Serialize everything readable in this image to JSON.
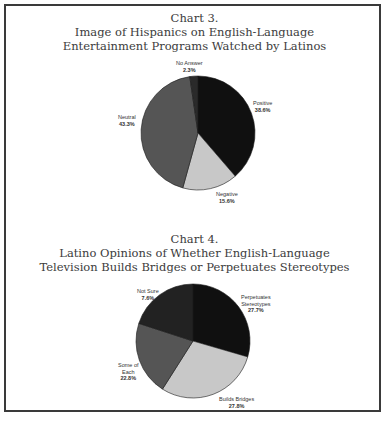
{
  "chart_data": [
    {
      "type": "pie",
      "title": "Chart 3.",
      "subtitle": "Image of Hispanics on English-Language Entertainment Programs Watched by Latinos",
      "title_lines": [
        "Chart 3.",
        "Image of Hispanics on English-Language",
        "Entertainment Programs Watched by Latinos"
      ],
      "categories": [
        "Positive",
        "Negative",
        "Neutral",
        "No Answer"
      ],
      "values": [
        38.6,
        15.6,
        43.3,
        2.3
      ],
      "labels": [
        "38.6%",
        "15.6%",
        "43.3%",
        "2.3%"
      ],
      "colors": [
        "#101010",
        "#c8c8c8",
        "#555555",
        "#2a2a2a"
      ],
      "start_angle_deg": 0,
      "direction": "clockwise",
      "legend": "none (direct labels)"
    },
    {
      "type": "pie",
      "title": "Chart 4.",
      "subtitle": "Latino Opinions of Whether English-Language Television Builds Bridges or Perpetuates Stereotypes",
      "title_lines": [
        "Chart 4.",
        "Latino Opinions of Whether English-Language",
        "Television Builds Bridges or Perpetuates Stereotypes"
      ],
      "categories": [
        "Perpetuates Stereotypes",
        "Builds Bridges",
        "Some of Each",
        "Not Sure"
      ],
      "values": [
        27.7,
        27.8,
        22.8,
        7.6
      ],
      "labels": [
        "27.7%",
        "27.8%",
        "22.8%",
        "7.6%"
      ],
      "visual_sweep_pct": [
        29.5,
        29.5,
        21.0,
        20.0
      ],
      "colors": [
        "#101010",
        "#c8c8c8",
        "#555555",
        "#222222"
      ],
      "start_angle_deg": 0,
      "direction": "clockwise",
      "legend": "none (direct labels)"
    }
  ],
  "chart3": {
    "title_line1": "Chart 3.",
    "title_line2": "Image of Hispanics on English-Language",
    "title_line3": "Entertainment Programs Watched by Latinos",
    "labels": {
      "positive": {
        "name": "Positive",
        "value": "38.6%"
      },
      "negative": {
        "name": "Negative",
        "value": "15.6%"
      },
      "neutral": {
        "name": "Neutral",
        "value": "43.3%"
      },
      "no_answer": {
        "name": "No Answer",
        "value": "2.3%"
      }
    }
  },
  "chart4": {
    "title_line1": "Chart 4.",
    "title_line2": "Latino Opinions of Whether English-Language",
    "title_line3": "Television Builds Bridges or Perpetuates Stereotypes",
    "labels": {
      "perpetuates": {
        "name1": "Perpetuates",
        "name2": "Stereotypes",
        "value": "27.7%"
      },
      "bridges": {
        "name": "Builds Bridges",
        "value": "27.8%"
      },
      "some": {
        "name1": "Some of",
        "name2": "Each",
        "value": "22.8%"
      },
      "not_sure": {
        "name": "Not Sure",
        "value": "7.6%"
      }
    }
  }
}
